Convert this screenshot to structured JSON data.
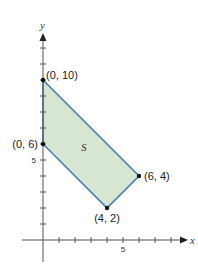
{
  "diagram": {
    "x_axis_label": "x",
    "y_axis_label": "y",
    "x_tick_label": "5",
    "y_tick_label": "5",
    "region_label": "S",
    "region_fill": "#d7e6d3",
    "region_stroke": "#4a7db3",
    "vertices": [
      {
        "label": "(0, 10)",
        "x": 0,
        "y": 10
      },
      {
        "label": "(0, 6)",
        "x": 0,
        "y": 6
      },
      {
        "label": "(4, 2)",
        "x": 4,
        "y": 2
      },
      {
        "label": "(6, 4)",
        "x": 6,
        "y": 4
      }
    ]
  }
}
